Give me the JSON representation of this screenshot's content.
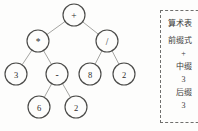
{
  "diagram": {
    "type": "binary-expression-tree",
    "expression": "3 * (6 - 2) + 8 / 2",
    "colors": {
      "background": "#fdfdfc",
      "node_stroke": "#4a4a48",
      "node_fill": "#fdfdfc",
      "edge_stroke": "#9a9a96",
      "text": "#2e2e2c",
      "panel_border": "#6f6f6d"
    },
    "nodes": [
      {
        "id": "n0",
        "label": "+",
        "kind": "operator",
        "cx": 74,
        "cy": 15,
        "r": 11
      },
      {
        "id": "n1",
        "label": "*",
        "kind": "operator",
        "cx": 38,
        "cy": 41,
        "r": 11
      },
      {
        "id": "n2",
        "label": "/",
        "kind": "operator",
        "cx": 107,
        "cy": 41,
        "r": 11
      },
      {
        "id": "n3",
        "label": "3",
        "kind": "operand",
        "cx": 16,
        "cy": 74,
        "r": 11
      },
      {
        "id": "n4",
        "label": "-",
        "kind": "operator",
        "cx": 57,
        "cy": 74,
        "r": 11
      },
      {
        "id": "n5",
        "label": "8",
        "kind": "operand",
        "cx": 90,
        "cy": 74,
        "r": 11
      },
      {
        "id": "n6",
        "label": "2",
        "kind": "operand",
        "cx": 124,
        "cy": 74,
        "r": 11
      },
      {
        "id": "n7",
        "label": "6",
        "kind": "operand",
        "cx": 39,
        "cy": 107,
        "r": 11
      },
      {
        "id": "n8",
        "label": "2",
        "kind": "operand",
        "cx": 76,
        "cy": 107,
        "r": 11
      }
    ],
    "edges": [
      {
        "from": "n0",
        "to": "n1"
      },
      {
        "from": "n0",
        "to": "n2"
      },
      {
        "from": "n1",
        "to": "n3"
      },
      {
        "from": "n1",
        "to": "n4"
      },
      {
        "from": "n2",
        "to": "n5"
      },
      {
        "from": "n2",
        "to": "n6"
      },
      {
        "from": "n4",
        "to": "n7"
      },
      {
        "from": "n4",
        "to": "n8"
      }
    ]
  },
  "note_panel": {
    "lines": [
      {
        "text": "算术表",
        "align": "left",
        "class": "title"
      },
      {
        "text": "前缀式",
        "align": "left",
        "class": ""
      },
      {
        "text": "+",
        "align": "center",
        "class": ""
      },
      {
        "text": "中缀",
        "align": "center",
        "class": ""
      },
      {
        "text": "3",
        "align": "center",
        "class": ""
      },
      {
        "text": "后缀",
        "align": "center",
        "class": ""
      },
      {
        "text": "3",
        "align": "center",
        "class": ""
      }
    ]
  }
}
